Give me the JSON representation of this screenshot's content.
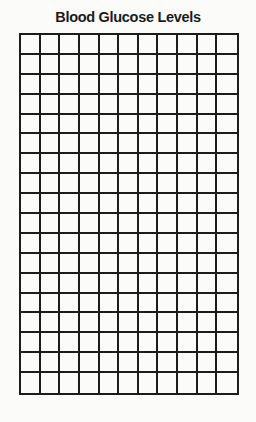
{
  "chart_data": {
    "type": "table",
    "title": "Blood Glucose Levels",
    "xlabel": "",
    "ylabel": "",
    "grid": true,
    "columns": 11,
    "rows": 18,
    "values": [],
    "colors": {
      "line": "#1c1c1c",
      "background": "#fbfbfa",
      "title": "#1a1a1a"
    }
  }
}
